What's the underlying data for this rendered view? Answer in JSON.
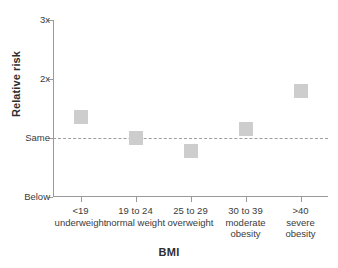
{
  "chart_data": {
    "type": "scatter",
    "title": "",
    "xlabel": "BMI",
    "ylabel": "Relative risk",
    "categories": [
      "<19\nunderweight",
      "19 to 24\nnormal weight",
      "25 to 29\noverweight",
      "30 to 39\nmoderate\nobesity",
      ">40\nsevere\nobesity"
    ],
    "category_lines": [
      [
        "<19",
        "underweight"
      ],
      [
        "19 to 24",
        "normal weight"
      ],
      [
        "25 to 29",
        "overweight"
      ],
      [
        "30 to 39",
        "moderate",
        "obesity"
      ],
      [
        ">40",
        "severe",
        "obesity"
      ]
    ],
    "values": [
      1.36,
      1.0,
      0.78,
      1.16,
      1.79
    ],
    "ytick_labels": [
      "Below",
      "Same",
      "2x",
      "3x"
    ],
    "ytick_values": [
      0.0,
      1.0,
      2.0,
      3.0
    ],
    "ylim": [
      0.0,
      3.0
    ],
    "grid": false,
    "legend": "none",
    "reference_line": {
      "value": 1.0,
      "label": "Same",
      "style": "dashed"
    },
    "marker_shape": "square",
    "marker_color": "#cdcdcd",
    "axis_color": "#9a9a9a"
  }
}
